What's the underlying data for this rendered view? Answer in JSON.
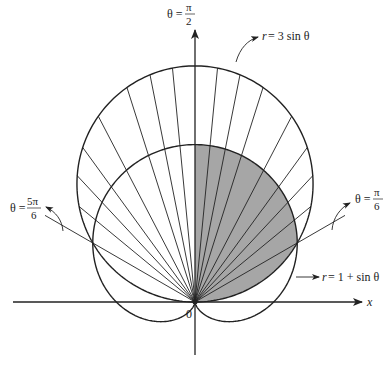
{
  "figure": {
    "type": "polar-region-diagram",
    "colors": {
      "stroke": "#222222",
      "shade": "#a6a6a6",
      "background": "#ffffff"
    },
    "geometry": {
      "origin": [
        195,
        302
      ],
      "scale_px_per_unit": 78.7
    },
    "curves": [
      {
        "name": "circle",
        "equation_label": "r = 3 sin θ",
        "r_lhs": "r",
        "rhs": "= 3 sin θ"
      },
      {
        "name": "cardioid",
        "equation_label": "r = 1 + sin θ",
        "r_lhs": "r",
        "rhs": "= 1 + sin θ"
      }
    ],
    "axes": {
      "x_label": "x",
      "origin_label": "0"
    },
    "angle_labels": {
      "top": {
        "prefix": "θ =",
        "num": "π",
        "den": "2"
      },
      "right": {
        "prefix": "θ =",
        "num": "π",
        "den": "6"
      },
      "left": {
        "prefix": "θ =",
        "num": "5π",
        "den": "6"
      }
    },
    "ray_angles_deg": [
      90,
      84.5,
      78.8,
      72.4,
      62.5,
      54,
      47,
      39.5,
      95.5,
      101.2,
      107.6,
      117.5,
      126,
      133,
      140.5
    ],
    "intersection_angles": [
      "π/6",
      "5π/6"
    ],
    "shaded_region": "θ from 0 to π/6 bounded by r = 3 sin θ; θ from π/6 to π/2 bounded by r = 1 + sin θ"
  }
}
